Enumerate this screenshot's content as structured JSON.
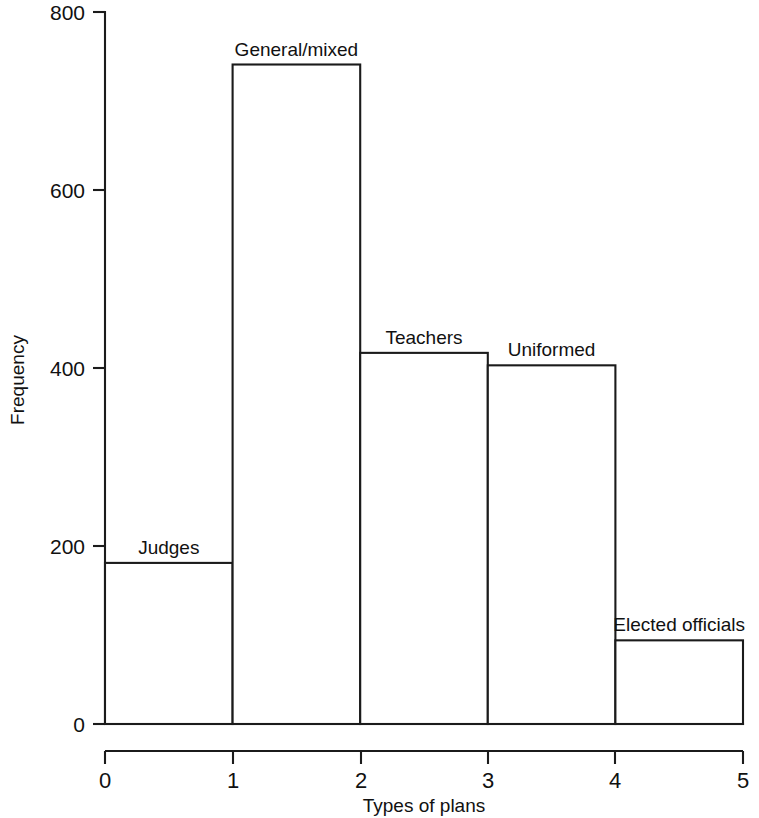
{
  "chart_data": {
    "type": "bar",
    "title": "",
    "subtitle": "",
    "xlabel": "Types of plans",
    "ylabel": "Frequency",
    "xlim": [
      0,
      5
    ],
    "ylim": [
      0,
      800
    ],
    "grid": false,
    "legend": null,
    "bin_edges": [
      0,
      1,
      2,
      3,
      4,
      5
    ],
    "x_tick_labels": [
      "0",
      "1",
      "2",
      "3",
      "4",
      "5"
    ],
    "y_tick_labels": [
      "0",
      "200",
      "400",
      "600",
      "800"
    ],
    "y_tick_values": [
      0,
      200,
      400,
      600,
      800
    ],
    "categories": [
      "Judges",
      "General/mixed",
      "Teachers",
      "Uniformed",
      "Elected officials"
    ],
    "values": [
      181,
      741,
      417,
      403,
      94
    ],
    "bars": [
      {
        "label": "Judges",
        "bin_start": 0,
        "bin_end": 1,
        "value": 181
      },
      {
        "label": "General/mixed",
        "bin_start": 1,
        "bin_end": 2,
        "value": 741
      },
      {
        "label": "Teachers",
        "bin_start": 2,
        "bin_end": 3,
        "value": 417
      },
      {
        "label": "Uniformed",
        "bin_start": 3,
        "bin_end": 4,
        "value": 403
      },
      {
        "label": "Elected officials",
        "bin_start": 4,
        "bin_end": 5,
        "value": 94
      }
    ],
    "colors": {
      "bar_fill": "#ffffff",
      "bar_stroke": "#1b1b1b",
      "axis": "#1b1b1b",
      "text": "#111111",
      "background": "#ffffff"
    }
  }
}
